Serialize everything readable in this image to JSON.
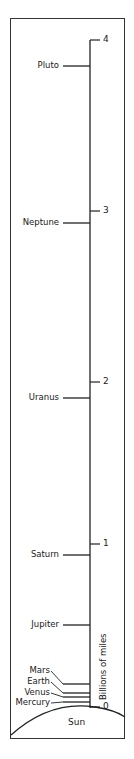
{
  "axis": {
    "label": "Billions of miles",
    "ticks": [
      {
        "value": 0,
        "label": "0",
        "y": 707
      },
      {
        "value": 1,
        "label": "1",
        "y": 544
      },
      {
        "value": 2,
        "label": "2",
        "y": 382
      },
      {
        "value": 3,
        "label": "3",
        "y": 211
      },
      {
        "value": 4,
        "label": "4",
        "y": 40
      }
    ]
  },
  "sun": {
    "label": "Sun"
  },
  "planets": [
    {
      "name": "Pluto",
      "label_y": 66,
      "line_y": 66
    },
    {
      "name": "Neptune",
      "label_y": 223,
      "line_y": 223
    },
    {
      "name": "Uranus",
      "label_y": 398,
      "line_y": 398
    },
    {
      "name": "Saturn",
      "label_y": 555,
      "line_y": 555
    },
    {
      "name": "Jupiter",
      "label_y": 625,
      "line_y": 625
    },
    {
      "name": "Mars",
      "label_y": 671,
      "line_y": 684
    },
    {
      "name": "Earth",
      "label_y": 682,
      "line_y": 693
    },
    {
      "name": "Venus",
      "label_y": 693,
      "line_y": 697
    },
    {
      "name": "Mercury",
      "label_y": 703,
      "line_y": 702
    }
  ],
  "chart_data": {
    "type": "scale",
    "title": "",
    "ylabel": "Billions of miles",
    "ylim": [
      0,
      4
    ],
    "ticks": [
      0,
      1,
      2,
      3,
      4
    ],
    "categories": [
      "Mercury",
      "Venus",
      "Earth",
      "Mars",
      "Jupiter",
      "Saturn",
      "Uranus",
      "Neptune",
      "Pluto"
    ],
    "values": [
      0.036,
      0.067,
      0.093,
      0.142,
      0.48,
      0.89,
      1.78,
      2.8,
      3.67
    ],
    "origin_label": "Sun"
  }
}
